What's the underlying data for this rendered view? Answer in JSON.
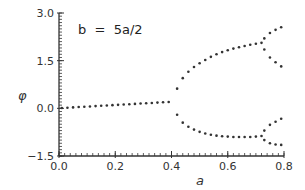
{
  "chart_data": {
    "type": "scatter",
    "title": "",
    "annotation": "b  =  5a/2",
    "xlabel": "a",
    "ylabel": "φ",
    "xlim": [
      0.0,
      0.8
    ],
    "ylim": [
      -1.5,
      3.0
    ],
    "xticks": [
      "0.0",
      "0.2",
      "0.4",
      "0.6",
      "0.8"
    ],
    "yticks": [
      "-1.5",
      "0.0",
      "1.5",
      "3.0"
    ],
    "grid": false,
    "legend": null,
    "marker_color": "#333333",
    "series": [
      {
        "name": "single-branch",
        "points": [
          [
            0.01,
            0.01
          ],
          [
            0.03,
            0.02
          ],
          [
            0.05,
            0.03
          ],
          [
            0.07,
            0.04
          ],
          [
            0.09,
            0.05
          ],
          [
            0.11,
            0.06
          ],
          [
            0.13,
            0.07
          ],
          [
            0.15,
            0.08
          ],
          [
            0.17,
            0.09
          ],
          [
            0.19,
            0.1
          ],
          [
            0.21,
            0.11
          ],
          [
            0.23,
            0.12
          ],
          [
            0.25,
            0.13
          ],
          [
            0.27,
            0.14
          ],
          [
            0.29,
            0.15
          ],
          [
            0.31,
            0.16
          ],
          [
            0.33,
            0.17
          ],
          [
            0.35,
            0.18
          ],
          [
            0.37,
            0.19
          ],
          [
            0.39,
            0.2
          ]
        ]
      },
      {
        "name": "upper-branch",
        "points": [
          [
            0.42,
            0.62
          ],
          [
            0.44,
            0.95
          ],
          [
            0.46,
            1.15
          ],
          [
            0.48,
            1.3
          ],
          [
            0.5,
            1.42
          ],
          [
            0.52,
            1.52
          ],
          [
            0.54,
            1.62
          ],
          [
            0.56,
            1.7
          ],
          [
            0.58,
            1.77
          ],
          [
            0.6,
            1.83
          ],
          [
            0.62,
            1.88
          ],
          [
            0.64,
            1.92
          ],
          [
            0.66,
            1.96
          ],
          [
            0.68,
            2.0
          ],
          [
            0.7,
            2.03
          ],
          [
            0.72,
            2.06
          ]
        ]
      },
      {
        "name": "upper-branch-high",
        "points": [
          [
            0.73,
            2.2
          ],
          [
            0.75,
            2.37
          ],
          [
            0.77,
            2.47
          ],
          [
            0.79,
            2.55
          ]
        ]
      },
      {
        "name": "upper-branch-low",
        "points": [
          [
            0.73,
            1.85
          ],
          [
            0.75,
            1.6
          ],
          [
            0.77,
            1.45
          ],
          [
            0.79,
            1.32
          ]
        ]
      },
      {
        "name": "lower-branch",
        "points": [
          [
            0.42,
            -0.2
          ],
          [
            0.44,
            -0.45
          ],
          [
            0.46,
            -0.58
          ],
          [
            0.48,
            -0.67
          ],
          [
            0.5,
            -0.74
          ],
          [
            0.52,
            -0.79
          ],
          [
            0.54,
            -0.83
          ],
          [
            0.56,
            -0.86
          ],
          [
            0.58,
            -0.88
          ],
          [
            0.6,
            -0.89
          ],
          [
            0.62,
            -0.9
          ],
          [
            0.64,
            -0.9
          ],
          [
            0.66,
            -0.9
          ],
          [
            0.68,
            -0.9
          ],
          [
            0.7,
            -0.89
          ],
          [
            0.72,
            -0.87
          ]
        ]
      },
      {
        "name": "lower-branch-high",
        "points": [
          [
            0.73,
            -0.7
          ],
          [
            0.75,
            -0.52
          ],
          [
            0.77,
            -0.42
          ],
          [
            0.79,
            -0.33
          ]
        ]
      },
      {
        "name": "lower-branch-low",
        "points": [
          [
            0.73,
            -1.0
          ],
          [
            0.75,
            -1.1
          ],
          [
            0.77,
            -1.14
          ],
          [
            0.79,
            -1.15
          ]
        ]
      }
    ]
  }
}
